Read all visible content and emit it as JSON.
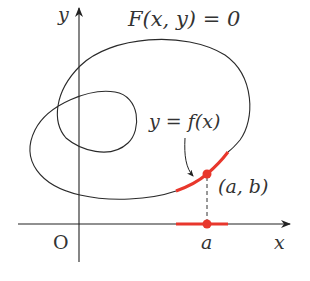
{
  "figure": {
    "title_equation": "F(x, y) = 0",
    "function_label": "y = f(x)",
    "point_label": "(a, b)",
    "x_tick_label": "a",
    "origin_label": "O",
    "x_axis_label": "x",
    "y_axis_label": "y",
    "colors": {
      "curve": "#2a2a2a",
      "highlight": "#e8372c",
      "axis": "#222222"
    }
  }
}
